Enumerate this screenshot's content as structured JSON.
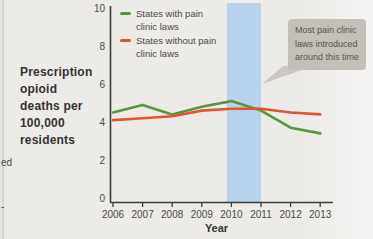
{
  "figure": {
    "background": "#edebe8"
  },
  "fragments": {
    "left_upper": "ed",
    "left_lower": "-"
  },
  "axis_label": {
    "lines": [
      "Prescription",
      "opioid",
      "deaths per",
      "100,000",
      "residents"
    ]
  },
  "legend": {
    "items": [
      {
        "name": "States with pain clinic laws",
        "lines": [
          "States with pain",
          "clinic laws"
        ],
        "color": "#5a9640"
      },
      {
        "name": "States without pain clinic laws",
        "lines": [
          "States without pain",
          "clinic laws"
        ],
        "color": "#e0552d"
      }
    ]
  },
  "annotation": {
    "lines": [
      "Most pain clinic",
      "laws introduced",
      "around this time"
    ],
    "box_color": "#c3c0ba",
    "tail_color": "#cbc8c3",
    "text_color": "#57544e"
  },
  "chart_data": {
    "type": "line",
    "title": "",
    "xlabel": "Year",
    "ylabel": "Prescription opioid deaths per 100,000 residents",
    "x": [
      2006,
      2007,
      2008,
      2009,
      2010,
      2011,
      2012,
      2013
    ],
    "series": [
      {
        "name": "States with pain clinic laws",
        "color": "#5a9640",
        "values": [
          4.5,
          4.9,
          4.4,
          4.8,
          5.1,
          4.6,
          3.7,
          3.4
        ]
      },
      {
        "name": "States without pain clinic laws",
        "color": "#e0552d",
        "values": [
          4.1,
          4.2,
          4.3,
          4.6,
          4.7,
          4.7,
          4.5,
          4.4
        ]
      }
    ],
    "ylim": [
      0,
      10
    ],
    "yticks": [
      0,
      2,
      4,
      6,
      8,
      10
    ],
    "grid": false,
    "legend_position": "top-left",
    "highlight_band": {
      "x_start": 2010,
      "x_end": 2011,
      "color": "#b8d2ec",
      "label": "Most pain clinic laws introduced around this time"
    },
    "axis_color": "#3d3c39",
    "tick_label_color": "#4b4a46"
  }
}
